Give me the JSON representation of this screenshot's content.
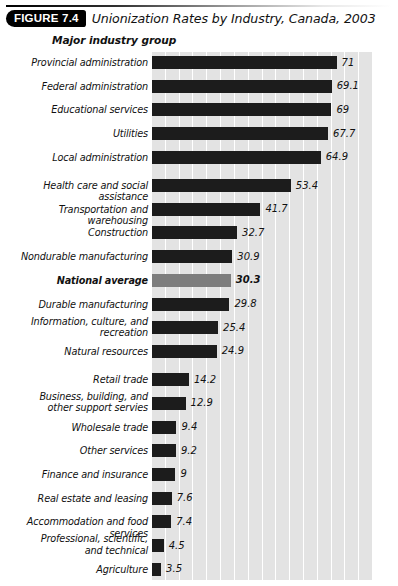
{
  "figure": {
    "badge": "FIGURE 7.4",
    "title": "Unionization Rates by Industry, Canada, 2003"
  },
  "axis_heading": "Major industry group",
  "colors": {
    "bar": "#1c1c1c",
    "highlight_bar": "#7d7d7d",
    "band": "#e3e3e3",
    "gridline": "#ffffff",
    "text": "#111111",
    "badge_bg": "#000000",
    "badge_text": "#ffffff"
  },
  "chart_data": {
    "type": "bar",
    "orientation": "horizontal",
    "title": "Unionization Rates by Industry, Canada, 2003",
    "xlabel": "",
    "ylabel": "Major industry group",
    "xlim": [
      0,
      80
    ],
    "grid": true,
    "legend": "none",
    "value_labels": true,
    "categories": [
      "Provincial administration",
      "Federal administration",
      "Educational services",
      "Utilities",
      "Local administration",
      "Health care and social assistance",
      "Transportation and warehousing",
      "Construction",
      "Nondurable manufacturing",
      "National average",
      "Durable manufacturing",
      "Information, culture, and recreation",
      "Natural resources",
      "Retail trade",
      "Business, building, and other support servies",
      "Wholesale trade",
      "Other services",
      "Finance and insurance",
      "Real estate and leasing",
      "Accommodation and food services",
      "Professional, scientific, and technical",
      "Agriculture"
    ],
    "values": [
      71,
      69.1,
      69,
      67.7,
      64.9,
      53.4,
      41.7,
      32.7,
      30.9,
      30.3,
      29.8,
      25.4,
      24.9,
      14.2,
      12.9,
      9.4,
      9.2,
      9,
      7.6,
      7.4,
      4.5,
      3.5
    ]
  },
  "rows": [
    {
      "label": "Provincial administration",
      "value": "71",
      "v": 71,
      "lines": 1,
      "highlight": false,
      "gap_after": false
    },
    {
      "label": "Federal administration",
      "value": "69.1",
      "v": 69.1,
      "lines": 1,
      "highlight": false,
      "gap_after": false
    },
    {
      "label": "Educational services",
      "value": "69",
      "v": 69,
      "lines": 1,
      "highlight": false,
      "gap_after": false
    },
    {
      "label": "Utilities",
      "value": "67.7",
      "v": 67.7,
      "lines": 1,
      "highlight": false,
      "gap_after": false
    },
    {
      "label": "Local administration",
      "value": "64.9",
      "v": 64.9,
      "lines": 1,
      "highlight": false,
      "gap_after": true
    },
    {
      "label": "Health care and social assistance",
      "value": "53.4",
      "v": 53.4,
      "lines": 1,
      "highlight": false,
      "gap_after": false
    },
    {
      "label": "Transportation and warehousing",
      "value": "41.7",
      "v": 41.7,
      "lines": 1,
      "highlight": false,
      "gap_after": false
    },
    {
      "label": "Construction",
      "value": "32.7",
      "v": 32.7,
      "lines": 1,
      "highlight": false,
      "gap_after": false
    },
    {
      "label": "Nondurable manufacturing",
      "value": "30.9",
      "v": 30.9,
      "lines": 1,
      "highlight": false,
      "gap_after": false
    },
    {
      "label": "National average",
      "value": "30.3",
      "v": 30.3,
      "lines": 1,
      "highlight": true,
      "gap_after": false
    },
    {
      "label": "Durable manufacturing",
      "value": "29.8",
      "v": 29.8,
      "lines": 1,
      "highlight": false,
      "gap_after": false
    },
    {
      "label": "Information, culture, and\nrecreation",
      "value": "25.4",
      "v": 25.4,
      "lines": 2,
      "highlight": false,
      "gap_after": false
    },
    {
      "label": "Natural resources",
      "value": "24.9",
      "v": 24.9,
      "lines": 1,
      "highlight": false,
      "gap_after": true
    },
    {
      "label": "Retail trade",
      "value": "14.2",
      "v": 14.2,
      "lines": 1,
      "highlight": false,
      "gap_after": false
    },
    {
      "label": "Business, building, and\nother support servies",
      "value": "12.9",
      "v": 12.9,
      "lines": 2,
      "highlight": false,
      "gap_after": false
    },
    {
      "label": "Wholesale trade",
      "value": "9.4",
      "v": 9.4,
      "lines": 1,
      "highlight": false,
      "gap_after": false
    },
    {
      "label": "Other services",
      "value": "9.2",
      "v": 9.2,
      "lines": 1,
      "highlight": false,
      "gap_after": false
    },
    {
      "label": "Finance and insurance",
      "value": "9",
      "v": 9,
      "lines": 1,
      "highlight": false,
      "gap_after": false
    },
    {
      "label": "Real estate and leasing",
      "value": "7.6",
      "v": 7.6,
      "lines": 1,
      "highlight": false,
      "gap_after": false
    },
    {
      "label": "Accommodation and food services",
      "value": "7.4",
      "v": 7.4,
      "lines": 1,
      "highlight": false,
      "gap_after": false
    },
    {
      "label": "Professional, scientific,\nand technical",
      "value": "4.5",
      "v": 4.5,
      "lines": 2,
      "highlight": false,
      "gap_after": false
    },
    {
      "label": "Agriculture",
      "value": "3.5",
      "v": 3.5,
      "lines": 1,
      "highlight": false,
      "gap_after": false
    }
  ],
  "layout": {
    "band_count": 16,
    "plot_left": 152,
    "plot_width": 220,
    "px_per_unit": 2.6,
    "row_pitch": 23.7,
    "bar_height": 13
  }
}
